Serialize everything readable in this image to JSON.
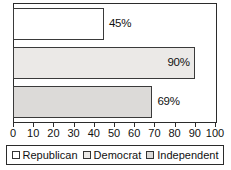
{
  "chart_data": {
    "type": "bar",
    "orientation": "horizontal",
    "title": "",
    "xlabel": "",
    "ylabel": "",
    "categories": [
      "Republican",
      "Democrat",
      "Independent"
    ],
    "values": [
      45,
      90,
      69
    ],
    "data_labels": [
      "45%",
      "90%",
      "69%"
    ],
    "label_placement": [
      "outside",
      "inside",
      "outside"
    ],
    "series": [
      {
        "name": "Percent",
        "values": [
          45,
          90,
          69
        ]
      }
    ],
    "xlim": [
      0,
      100
    ],
    "xticks": [
      0,
      10,
      20,
      30,
      40,
      50,
      60,
      70,
      80,
      90,
      100
    ],
    "xtick_labels": [
      "0",
      "10",
      "20",
      "30",
      "40",
      "50",
      "60",
      "70",
      "80",
      "90",
      "100"
    ],
    "grid": false,
    "legend_position": "bottom",
    "bar_colors": [
      "#ffffff",
      "#ebe9e7",
      "#dcdad8"
    ],
    "bar_border_color": "#3a3a3a",
    "axis_color": "#2b2b2b",
    "background_color": "#ffffff"
  },
  "legend": {
    "items": [
      {
        "label": "Republican",
        "color": "#ffffff"
      },
      {
        "label": "Democrat",
        "color": "#ebe9e7"
      },
      {
        "label": "Independent",
        "color": "#dcdad8"
      }
    ]
  }
}
